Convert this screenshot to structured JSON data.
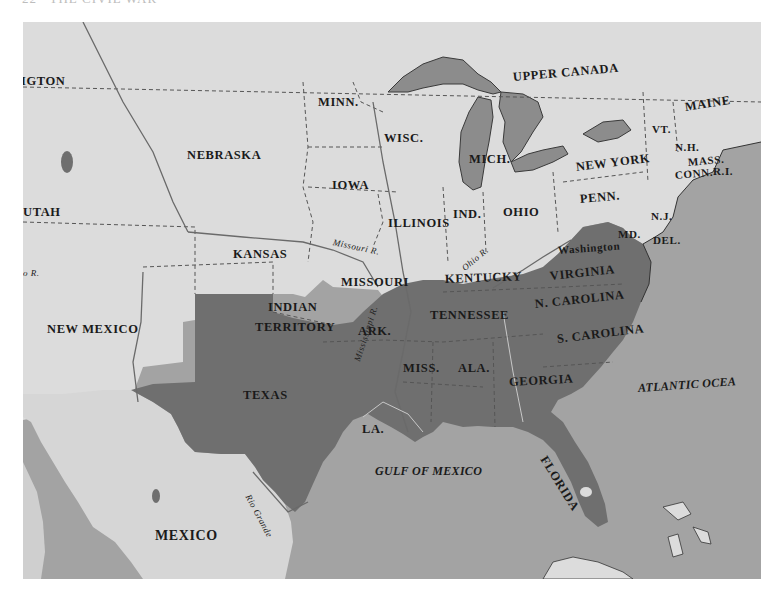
{
  "page": {
    "header": "22   THE CIVIL WAR"
  },
  "map": {
    "colors": {
      "water": "#a3a3a3",
      "union_and_territories": "#dcdcdc",
      "confederacy": "#6f6f6f",
      "foreign": "#d6d6d6",
      "border": "#3a3a3a"
    },
    "regions": {
      "washington_territory": "IGTON",
      "utah": "UTAH",
      "nebraska": "NEBRASKA",
      "kansas": "KANSAS",
      "new_mexico": "NEW MEXICO",
      "indian_territory_1": "INDIAN",
      "indian_territory_2": "TERRITORY",
      "texas": "TEXAS",
      "mexico": "MEXICO",
      "minn": "MINN.",
      "wisc": "WISC.",
      "iowa": "IOWA",
      "mich": "MICH.",
      "illinois": "ILLINOIS",
      "ind": "IND.",
      "ohio": "OHIO",
      "missouri": "MISSOURI",
      "kentucky": "KENTUCKY",
      "upper_canada": "UPPER CANADA",
      "maine": "MAINE",
      "vt": "VT.",
      "nh": "N.H.",
      "mass": "MASS.",
      "conn": "CONN.",
      "ri": "R.I.",
      "new_york": "NEW YORK",
      "penn": "PENN.",
      "nj": "N.J.",
      "md": "MD.",
      "del": "DEL.",
      "washington_dc": "Washington",
      "virginia": "VIRGINIA",
      "n_carolina": "N. CAROLINA",
      "s_carolina": "S. CAROLINA",
      "tennessee": "TENNESSEE",
      "ark": "ARK.",
      "miss": "MISS.",
      "ala": "ALA.",
      "georgia": "GEORGIA",
      "la": "LA.",
      "florida": "FLORIDA"
    },
    "rivers": {
      "missouri": "Missouri R.",
      "ohio": "Ohio R.",
      "mississippi": "Mississippi R.",
      "rio_grande": "Rio Grande",
      "colorado_partial": "o R."
    },
    "water_bodies": {
      "atlantic": "ATLANTIC OCEA",
      "gulf": "GULF OF MEXICO"
    }
  }
}
